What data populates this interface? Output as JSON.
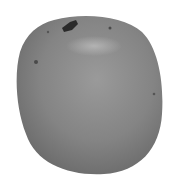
{
  "image": {
    "subject": "fruit",
    "description": "Grayscale photograph of a single rounded fruit (apple/mango) with a dark stem at top, on white background",
    "colors": {
      "background": "#ffffff",
      "body_dark": "#6e6e6e",
      "body_mid": "#8a8a8a",
      "highlight": "#b4b4b4",
      "stem": "#2a2a2a"
    }
  }
}
